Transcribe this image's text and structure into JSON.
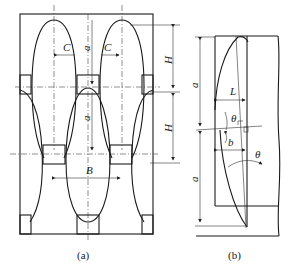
{
  "figure_a": {
    "caption": "(a)",
    "labels": {
      "c_left": "C",
      "c_right": "C",
      "a_top": "a",
      "a_bottom": "a",
      "h_top": "H",
      "h_bottom": "H",
      "b": "B"
    }
  },
  "figure_b": {
    "caption": "(b)",
    "labels": {
      "a_top": "a",
      "a_bottom": "a",
      "l": "L",
      "theta_top": "θ",
      "b": "b",
      "theta_bottom": "θ"
    }
  }
}
